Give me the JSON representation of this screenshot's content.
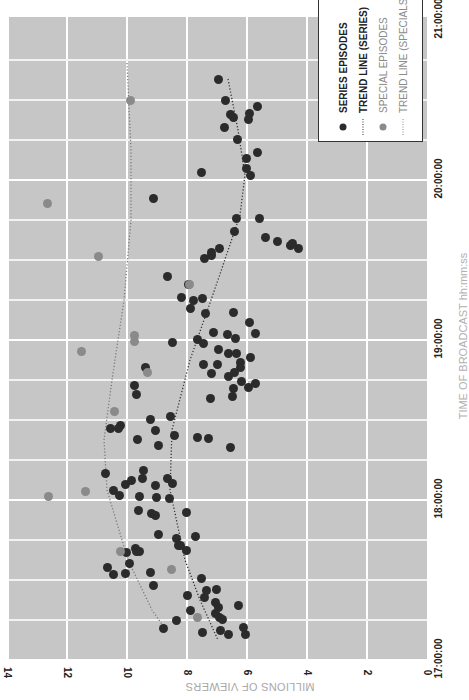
{
  "chart_data": {
    "type": "scatter",
    "title": "",
    "orientation": "rotated 90deg clockwise (time axis runs vertically on the right, viewers axis along the bottom)",
    "xlabel": "TIME OF BROADCAST hh:mm:ss",
    "ylabel": "MILLIONS OF VIEWERS",
    "x_ticks": [
      "17:00:00",
      "18:00:00",
      "19:00:00",
      "20:00:00",
      "21:00:00"
    ],
    "y_ticks": [
      0,
      2,
      4,
      6,
      8,
      10,
      12,
      14
    ],
    "xlim": [
      "17:00:00",
      "21:00:00"
    ],
    "ylim": [
      0,
      14
    ],
    "grid": true,
    "legend_position": "top-right",
    "legend": [
      {
        "label": "SERIES EPISODES",
        "marker": "dot",
        "color": "#2b2b2b"
      },
      {
        "label": "TREND LINE (SERIES)",
        "marker": "dotted-line",
        "color": "#333333"
      },
      {
        "label": "SPECIAL EPISODES",
        "marker": "dot",
        "color": "#8a8a8a"
      },
      {
        "label": "TREND LINE (SPECIALS)",
        "marker": "dotted-line",
        "color": "#8a8a8a"
      }
    ],
    "series": [
      {
        "name": "SERIES EPISODES",
        "color": "#2b2b2b",
        "points_px": [
          [
            218,
            79
          ],
          [
            225,
            100
          ],
          [
            230,
            114
          ],
          [
            233,
            117
          ],
          [
            249,
            113
          ],
          [
            248,
            119
          ],
          [
            224,
            127
          ],
          [
            257,
            106
          ],
          [
            237,
            139
          ],
          [
            257,
            152
          ],
          [
            246,
            158
          ],
          [
            246,
            168
          ],
          [
            250,
            175
          ],
          [
            201,
            172
          ],
          [
            153,
            198
          ],
          [
            259,
            218
          ],
          [
            236,
            218
          ],
          [
            234,
            231
          ],
          [
            265,
            237
          ],
          [
            277,
            241
          ],
          [
            290,
            245
          ],
          [
            292,
            243
          ],
          [
            298,
            248
          ],
          [
            219,
            248
          ],
          [
            211,
            252
          ],
          [
            211,
            255
          ],
          [
            204,
            258
          ],
          [
            167,
            276
          ],
          [
            188,
            284
          ],
          [
            181,
            297
          ],
          [
            202,
            298
          ],
          [
            190,
            308
          ],
          [
            193,
            300
          ],
          [
            205,
            313
          ],
          [
            233,
            312
          ],
          [
            249,
            322
          ],
          [
            197,
            339
          ],
          [
            213,
            332
          ],
          [
            255,
            333
          ],
          [
            227,
            334
          ],
          [
            235,
            338
          ],
          [
            236,
            353
          ],
          [
            228,
            353
          ],
          [
            203,
            343
          ],
          [
            218,
            349
          ],
          [
            240,
            362
          ],
          [
            203,
            364
          ],
          [
            240,
            367
          ],
          [
            217,
            364
          ],
          [
            250,
            357
          ],
          [
            234,
            372
          ],
          [
            228,
            376
          ],
          [
            241,
            381
          ],
          [
            233,
            388
          ],
          [
            211,
            373
          ],
          [
            232,
            396
          ],
          [
            255,
            383
          ],
          [
            248,
            387
          ],
          [
            210,
            398
          ],
          [
            172,
            342
          ],
          [
            145,
            367
          ],
          [
            134,
            385
          ],
          [
            136,
            394
          ],
          [
            120,
            425
          ],
          [
            118,
            428
          ],
          [
            137,
            439
          ],
          [
            110,
            428
          ],
          [
            150,
            419
          ],
          [
            170,
            416
          ],
          [
            155,
            430
          ],
          [
            174,
            435
          ],
          [
            158,
            445
          ],
          [
            197,
            437
          ],
          [
            208,
            438
          ],
          [
            230,
            447
          ],
          [
            143,
            470
          ],
          [
            142,
            478
          ],
          [
            167,
            478
          ],
          [
            131,
            480
          ],
          [
            125,
            484
          ],
          [
            105,
            473
          ],
          [
            155,
            485
          ],
          [
            113,
            490
          ],
          [
            156,
            497
          ],
          [
            119,
            495
          ],
          [
            139,
            496
          ],
          [
            151,
            513
          ],
          [
            138,
            510
          ],
          [
            155,
            515
          ],
          [
            172,
            483
          ],
          [
            169,
            498
          ],
          [
            186,
            512
          ],
          [
            195,
            536
          ],
          [
            158,
            534
          ],
          [
            176,
            538
          ],
          [
            178,
            545
          ],
          [
            186,
            550
          ],
          [
            135,
            548
          ],
          [
            136,
            551
          ],
          [
            126,
            552
          ],
          [
            107,
            567
          ],
          [
            113,
            574
          ],
          [
            129,
            563
          ],
          [
            139,
            551
          ],
          [
            125,
            573
          ],
          [
            150,
            572
          ],
          [
            180,
            545
          ],
          [
            201,
            578
          ],
          [
            153,
            585
          ],
          [
            187,
            595
          ],
          [
            206,
            590
          ],
          [
            204,
            597
          ],
          [
            216,
            589
          ],
          [
            215,
            602
          ],
          [
            218,
            607
          ],
          [
            238,
            605
          ],
          [
            190,
            610
          ],
          [
            176,
            620
          ],
          [
            215,
            613
          ],
          [
            219,
            617
          ],
          [
            222,
            619
          ],
          [
            243,
            627
          ],
          [
            220,
            630
          ],
          [
            202,
            632
          ],
          [
            228,
            634
          ],
          [
            245,
            634
          ],
          [
            163,
            628
          ]
        ]
      },
      {
        "name": "SPECIAL EPISODES",
        "color": "#8a8a8a",
        "points_px": [
          [
            130,
            100
          ],
          [
            47,
            203
          ],
          [
            98,
            256
          ],
          [
            189,
            284
          ],
          [
            81,
            351
          ],
          [
            134,
            335
          ],
          [
            134,
            341
          ],
          [
            147,
            372
          ],
          [
            114,
            411
          ],
          [
            85,
            491
          ],
          [
            48,
            496
          ],
          [
            120,
            551
          ],
          [
            171,
            569
          ],
          [
            197,
            617
          ]
        ]
      }
    ],
    "trend_lines": [
      {
        "name": "TREND LINE (SERIES)",
        "color": "#333333",
        "points_px": [
          [
            228,
            79
          ],
          [
            238,
            130
          ],
          [
            245,
            175
          ],
          [
            240,
            215
          ],
          [
            218,
            280
          ],
          [
            190,
            360
          ],
          [
            172,
            430
          ],
          [
            170,
            490
          ],
          [
            185,
            560
          ],
          [
            200,
            600
          ],
          [
            218,
            640
          ]
        ]
      },
      {
        "name": "TREND LINE (SPECIALS)",
        "color": "#7a7a7a",
        "points_px": [
          [
            127,
            63
          ],
          [
            131,
            150
          ],
          [
            131,
            220
          ],
          [
            124,
            300
          ],
          [
            112,
            380
          ],
          [
            104,
            440
          ],
          [
            107,
            490
          ],
          [
            128,
            560
          ],
          [
            152,
            610
          ],
          [
            166,
            630
          ]
        ]
      }
    ],
    "pixel_mapping": {
      "viewers_zero_x": 427,
      "px_per_million": 30,
      "time_1700_y": 659,
      "px_per_hour": 160
    }
  }
}
